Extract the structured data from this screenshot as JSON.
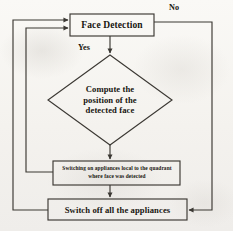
{
  "diagram": {
    "stroke_color": "#3b3833",
    "background_color": "#f4f2ee",
    "text_color": "#17150f",
    "nodes": [
      {
        "id": "face-detection",
        "shape": "process",
        "label": "Face Detection"
      },
      {
        "id": "compute-position",
        "shape": "decision",
        "label": "Compute the position of the detected face"
      },
      {
        "id": "switch-on",
        "shape": "process",
        "label": "Switching on appliances local to the quadrant where face was detected"
      },
      {
        "id": "switch-off",
        "shape": "process",
        "label": "Switch off all the appliances"
      }
    ],
    "edge_labels": {
      "no": "No",
      "yes": "Yes"
    },
    "edges": [
      {
        "from": "face-detection",
        "to": "compute-position",
        "label": "Yes"
      },
      {
        "from": "face-detection",
        "to": "switch-off",
        "label": "No"
      },
      {
        "from": "compute-position",
        "to": "switch-on",
        "label": ""
      },
      {
        "from": "switch-on",
        "to": "switch-off",
        "label": ""
      },
      {
        "from": "switch-on",
        "to": "face-detection",
        "label": ""
      },
      {
        "from": "switch-off",
        "to": "face-detection",
        "label": ""
      }
    ]
  }
}
